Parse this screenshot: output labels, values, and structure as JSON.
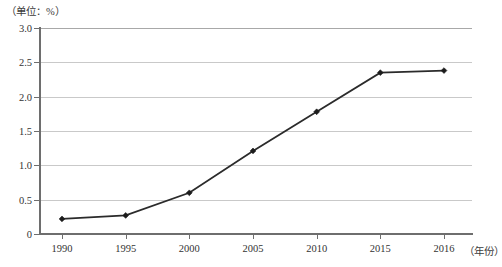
{
  "chart_data": {
    "type": "line",
    "title": "",
    "unit_label": "（单位：%）",
    "xlabel": "（年份）",
    "ylabel": "",
    "categories": [
      "1990",
      "1995",
      "2000",
      "2005",
      "2010",
      "2015",
      "2016"
    ],
    "values": [
      0.22,
      0.27,
      0.6,
      1.21,
      1.78,
      2.35,
      2.38
    ],
    "series": [
      {
        "name": "",
        "values": [
          0.22,
          0.27,
          0.6,
          1.21,
          1.78,
          2.35,
          2.38
        ]
      }
    ],
    "ylim": [
      0,
      3.0
    ],
    "yticks": [
      "0",
      "0.5",
      "1.0",
      "1.5",
      "2.0",
      "2.5",
      "3.0"
    ],
    "ytick_values": [
      0,
      0.5,
      1.0,
      1.5,
      2.0,
      2.5,
      3.0
    ],
    "grid": "horizontal",
    "legend": "none",
    "marker": "diamond",
    "line_color": "#2b2b2b",
    "grid_color": "#c9c9c9",
    "axis_color": "#6e6e6e"
  }
}
